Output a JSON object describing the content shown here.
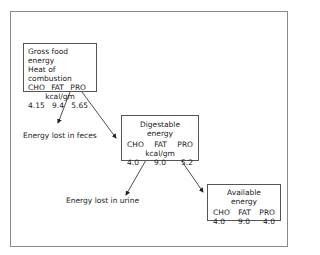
{
  "boxes": {
    "gross": {
      "title1": "Gross food energy",
      "title2": "Heat of combustion",
      "headers": [
        "CHO",
        "FAT",
        "PRO"
      ],
      "unit": "kcal/gm",
      "values": [
        "4.15",
        "9.4",
        "5.65"
      ]
    },
    "digestable": {
      "title": "Digestable energy",
      "headers": [
        "CHO",
        "FAT",
        "PRO"
      ],
      "unit": "kcal/gm",
      "values": [
        "4.0",
        "9.0",
        "5.2"
      ]
    },
    "available": {
      "title": "Available energy",
      "headers": [
        "CHO",
        "FAT",
        "PRO"
      ],
      "values": [
        "4.0",
        "9.0",
        "4.0"
      ]
    }
  },
  "labels": {
    "feces": "Energy lost in feces",
    "urine": "Energy lost in urine"
  }
}
